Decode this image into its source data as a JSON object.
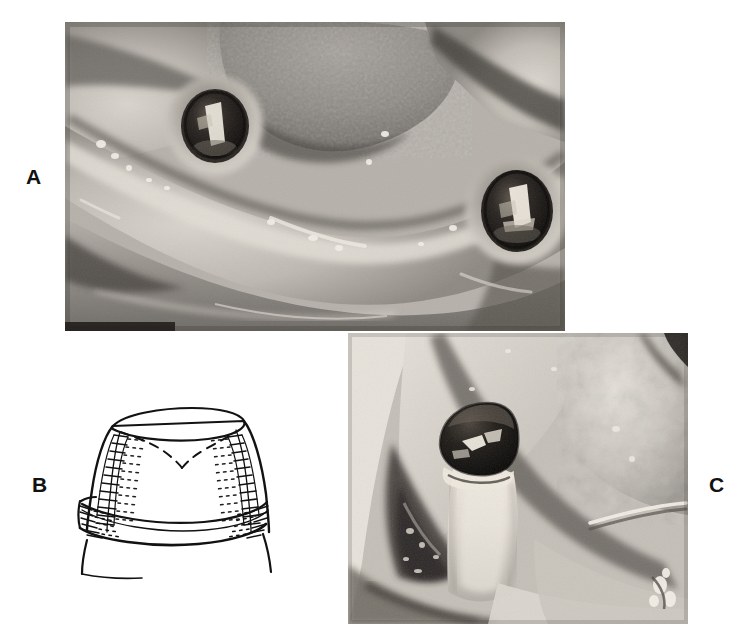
{
  "figure": {
    "type": "composite-clinical-figure",
    "panel_count": 3,
    "background_color": "#ffffff",
    "width": 747,
    "height": 644
  },
  "panels": [
    {
      "id": "a",
      "label": "A",
      "kind": "photograph",
      "tone": "grayscale",
      "subject": "intraoral occlusal view of edentulous mandibular arch with two exposed dental implant abutments",
      "bounds": {
        "x": 65,
        "y": 22,
        "w": 500,
        "h": 309
      },
      "label_position": {
        "x": 26,
        "y": 166
      },
      "features": [
        {
          "name": "left-implant-abutment",
          "cx": 150,
          "cy": 103,
          "rx": 30,
          "ry": 34,
          "tone": "#1a1714"
        },
        {
          "name": "right-implant-abutment",
          "cx": 452,
          "cy": 188,
          "rx": 32,
          "ry": 38,
          "tone": "#171310"
        },
        {
          "name": "tongue-dorsum",
          "tone": "#8e8a85"
        },
        {
          "name": "alveolar-ridge-crest",
          "tone": "#cfcac3"
        },
        {
          "name": "buccal-vestibule-shadow",
          "tone": "#6a6660"
        }
      ]
    },
    {
      "id": "b",
      "label": "B",
      "kind": "line-drawing",
      "tone": "ink-on-white",
      "subject": "schematic cross-section of a telescopic coping / crown seated over an abutment, hatched lateral walls and dashed internal outline",
      "bounds": {
        "x": 58,
        "y": 382,
        "w": 250,
        "h": 200
      },
      "label_position": {
        "x": 32,
        "y": 474
      },
      "features": [
        {
          "name": "coping-occlusal-ellipse",
          "style": "solid-outline"
        },
        {
          "name": "left-hatched-wall",
          "style": "hatched"
        },
        {
          "name": "right-hatched-wall",
          "style": "hatched"
        },
        {
          "name": "internal-dashed-margin",
          "style": "dashed"
        },
        {
          "name": "cervical-collar-band",
          "style": "solid-double-line"
        },
        {
          "name": "root-silhouette",
          "style": "solid-outline"
        }
      ]
    },
    {
      "id": "c",
      "label": "C",
      "kind": "photograph",
      "tone": "grayscale",
      "subject": "close-up lateral intraoral view of a single dark metallic crown seated on an abutment post with surrounding soft tissue",
      "bounds": {
        "x": 348,
        "y": 333,
        "w": 340,
        "h": 291
      },
      "label_position": {
        "x": 709,
        "y": 474
      },
      "features": [
        {
          "name": "metal-crown-cap",
          "cx": 128,
          "cy": 112,
          "rx": 40,
          "ry": 30,
          "tone": "#120f0d"
        },
        {
          "name": "abutment-post",
          "tone": "#d8d3cb"
        },
        {
          "name": "soft-tissue-sulcus-shadow",
          "tone": "#4e4a45"
        },
        {
          "name": "mucosa-highlight",
          "tone": "#ded8d0"
        }
      ]
    }
  ],
  "palette": {
    "page_background": "#ffffff",
    "ink": "#111111",
    "photo_mid_gray": "#b9b6b1",
    "photo_highlight": "#eae5de",
    "photo_shadow": "#3a3733",
    "photo_deep_black": "#141210"
  }
}
